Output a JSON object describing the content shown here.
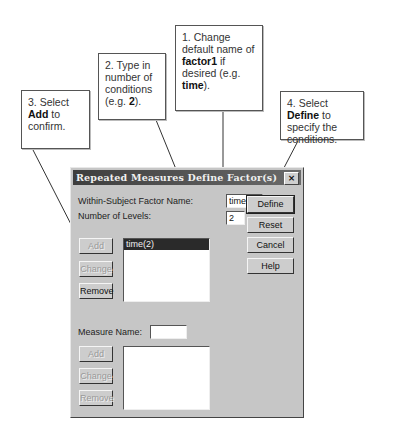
{
  "callouts": [
    {
      "id": 1,
      "parts": [
        [
          "1. Change default name of ",
          false
        ],
        [
          "factor1",
          true
        ],
        [
          " if desired (e.g. ",
          false
        ],
        [
          "time",
          true
        ],
        [
          ").",
          false
        ]
      ]
    },
    {
      "id": 2,
      "parts": [
        [
          "2. Type in number of conditions (e.g. ",
          false
        ],
        [
          "2",
          true
        ],
        [
          ").",
          false
        ]
      ]
    },
    {
      "id": 3,
      "parts": [
        [
          "3. Select ",
          false
        ],
        [
          "Add",
          true
        ],
        [
          " to confirm.",
          false
        ]
      ]
    },
    {
      "id": 4,
      "parts": [
        [
          "4. Select ",
          false
        ],
        [
          "Define",
          true
        ],
        [
          " to specify the conditions.",
          false
        ]
      ]
    }
  ],
  "dialog": {
    "title": "Repeated Measures Define Factor(s)",
    "close_icon": "×",
    "factor_name_label": "Within-Subject Factor Name:",
    "factor_name_value": "time",
    "levels_label": "Number of Levels:",
    "levels_value": "2",
    "factor_buttons": {
      "add": "Add",
      "change": "Change",
      "remove": "Remove"
    },
    "factor_list": [
      "time(2)"
    ],
    "side_buttons": {
      "define": "Define",
      "reset": "Reset",
      "cancel": "Cancel",
      "help": "Help"
    },
    "measure_name_label": "Measure Name:",
    "measure_name_value": "",
    "measure_buttons": {
      "add": "Add",
      "change": "Change",
      "remove": "Remove"
    },
    "measure_list": []
  }
}
